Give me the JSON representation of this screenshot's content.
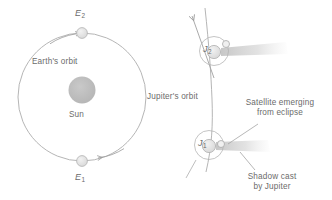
{
  "figure": {
    "background_color": "#ffffff",
    "stroke_color": "#9a9a9a",
    "text_color": "#6b6b6b",
    "sun_color": "#bdbdbd",
    "body_fill": "#e8e8e8",
    "shadow_color": "#dcdcdc"
  },
  "labels": {
    "earth_orbit": "Earth's orbit",
    "sun": "Sun",
    "earth_position_2_base": "E",
    "earth_position_2_sub": "2",
    "earth_position_1_base": "E",
    "earth_position_1_sub": "1",
    "jupiter_orbit": "Jupiter's orbit",
    "jupiter_position_2_base": "J",
    "jupiter_position_2_sub": "2",
    "jupiter_position_1_base": "J",
    "jupiter_position_1_sub": "1",
    "satellite_emerging_line1": "Satellite emerging",
    "satellite_emerging_line2": "from eclipse",
    "shadow_cast_line1": "Shadow cast",
    "shadow_cast_line2": "by Jupiter"
  },
  "elements": {
    "earth_orbit_circle": "earth-orbit-circle",
    "sun_disc": "sun-disc",
    "earth_e2": "earth-body-e2",
    "earth_e1": "earth-body-e1",
    "direction_arrow_e2": "orbit-direction-arrow-e2",
    "direction_arrow_e1": "orbit-direction-arrow-e1",
    "jupiter_orbit_arc": "jupiter-orbit-arc",
    "jupiter_direction_arrow": "jupiter-direction-arrow",
    "jupiter_j2_disc": "jupiter-disc-j2",
    "jupiter_j1_disc": "jupiter-disc-j1",
    "satellite_orbit_j2": "satellite-orbit-circle-j2",
    "satellite_orbit_j1": "satellite-orbit-circle-j1",
    "satellite_j2": "satellite-body-j2",
    "satellite_j1": "satellite-body-j1",
    "shadow_cone_j2": "shadow-cone-j2",
    "shadow_cone_j1": "shadow-cone-j1",
    "leader_satellite": "leader-line-satellite-emerging",
    "leader_shadow": "leader-line-shadow-cast"
  }
}
